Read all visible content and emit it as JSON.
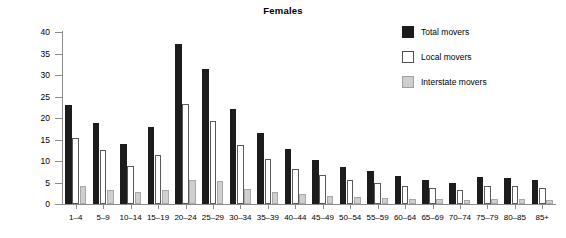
{
  "chart": {
    "title": "Females",
    "ylabel": "Percent"
  },
  "legend": {
    "position": "top-right",
    "items": [
      {
        "label": "Total movers",
        "key": "total",
        "color": "#1c1c1c",
        "swatch": "filled-black"
      },
      {
        "label": "Local movers",
        "key": "local",
        "color": "#ffffff",
        "swatch": "outline-white"
      },
      {
        "label": "Interstate movers",
        "key": "interstate",
        "color": "#cfcfcf",
        "swatch": "filled-gray"
      }
    ]
  },
  "chart_data": {
    "type": "bar",
    "title": "Females",
    "xlabel": "",
    "ylabel": "Percent",
    "ylim": [
      0,
      40
    ],
    "yticks": [
      0,
      5,
      10,
      15,
      20,
      25,
      30,
      35,
      40
    ],
    "grid": false,
    "legend_position": "top right",
    "categories": [
      "1–4",
      "5–9",
      "10–14",
      "15–19",
      "20–24",
      "25–29",
      "30–34",
      "35–39",
      "40–44",
      "45–49",
      "50–54",
      "55–59",
      "60–64",
      "65–69",
      "70–74",
      "75–79",
      "80–85",
      "85+"
    ],
    "series": [
      {
        "name": "Total movers",
        "color": "#1c1c1c",
        "values": [
          23.1,
          18.8,
          13.9,
          17.9,
          37.3,
          31.4,
          22.0,
          16.4,
          12.8,
          10.2,
          8.6,
          7.6,
          6.4,
          5.6,
          4.8,
          6.2,
          6.1,
          5.5
        ]
      },
      {
        "name": "Local movers",
        "color": "#ffffff",
        "values": [
          15.3,
          12.6,
          8.8,
          11.4,
          23.3,
          19.2,
          13.7,
          10.5,
          8.2,
          6.7,
          5.6,
          5.0,
          4.2,
          3.8,
          3.2,
          4.2,
          4.1,
          3.7
        ]
      },
      {
        "name": "Interstate movers",
        "color": "#cfcfcf",
        "values": [
          4.2,
          3.3,
          2.9,
          3.3,
          5.6,
          5.4,
          3.5,
          2.9,
          2.4,
          1.8,
          1.6,
          1.4,
          1.2,
          1.1,
          0.9,
          1.2,
          1.2,
          1.0
        ]
      }
    ]
  }
}
